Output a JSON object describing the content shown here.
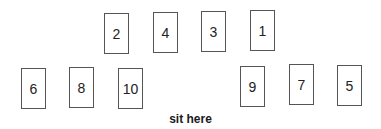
{
  "seats": {
    "top_row": [
      {
        "label": "2",
        "x": 104,
        "y": 13
      },
      {
        "label": "4",
        "x": 153,
        "y": 12
      },
      {
        "label": "3",
        "x": 201,
        "y": 11
      },
      {
        "label": "1",
        "x": 250,
        "y": 10
      }
    ],
    "bottom_row": [
      {
        "label": "6",
        "x": 21,
        "y": 68
      },
      {
        "label": "8",
        "x": 69,
        "y": 67
      },
      {
        "label": "10",
        "x": 118,
        "y": 68
      },
      {
        "label": "9",
        "x": 240,
        "y": 66
      },
      {
        "label": "7",
        "x": 289,
        "y": 64
      },
      {
        "label": "5",
        "x": 337,
        "y": 65
      }
    ]
  },
  "caption": "sit here"
}
